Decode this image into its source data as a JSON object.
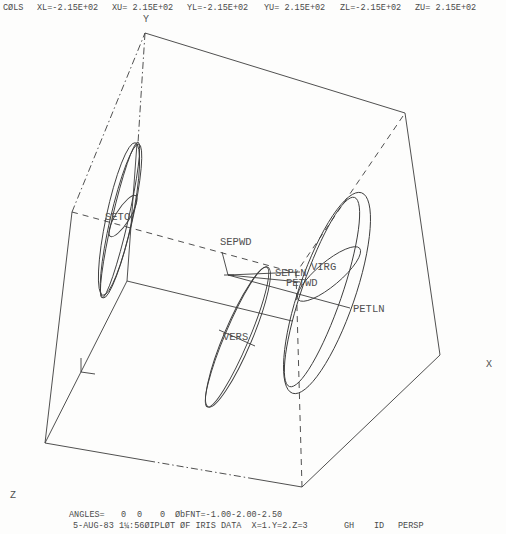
{
  "header": {
    "cols": "CØLS",
    "xl": "XL=-2.15E+02",
    "xu": "XU= 2.15E+02",
    "yl": "YL=-2.15E+02",
    "yu": "YU= 2.15E+02",
    "zl": "ZL=-2.15E+02",
    "zu": "ZU= 2.15E+02"
  },
  "axis_labels": {
    "x": "X",
    "y": "Y",
    "z": "Z"
  },
  "group_labels": {
    "seto": "SETO",
    "vers": "VERS",
    "virg": "VIRG"
  },
  "variable_labels": {
    "sepwd": "SEPWD",
    "sepln": "SEPLN",
    "petwd": "PETWD",
    "petln": "PETLN"
  },
  "footer": {
    "angles_label": "ANGLES=",
    "angles": [
      "0",
      "0",
      "0"
    ],
    "obpnt": "ØbFNT=-1.00-2.00-2.50",
    "info_line": "5-AUG-83 1¼:56ØIPLØT ØF IRIS DATA  X=1.Y=2.Z=3",
    "gh": "GH",
    "id": "ID",
    "persp": "PERSP"
  },
  "chart_data": {
    "type": "scatter",
    "subtype": "3d perspective group-ellipse plot",
    "title": "PLØT ØF IRIS DATA",
    "xlabel": "X",
    "ylabel": "Y",
    "zlabel": "Z",
    "axis_variables": {
      "x": 1,
      "y": 2,
      "z": 3
    },
    "xlim": [
      -215,
      215
    ],
    "ylim": [
      -215,
      215
    ],
    "zlim": [
      -215,
      215
    ],
    "angles": [
      0,
      0,
      0
    ],
    "observer_point": [
      -1.0,
      -2.0,
      -2.5
    ],
    "projection": "PERSP",
    "groups": [
      "SETO",
      "VERS",
      "VIRG"
    ],
    "variable_vectors": [
      "SEPWD",
      "SEPLN",
      "PETWD",
      "PETLN"
    ],
    "grid": false,
    "legend": null
  },
  "plot": {
    "stroke": "#3c3c3c",
    "solid_lines": [
      [
        145,
        33,
        405,
        113
      ],
      [
        405,
        113,
        440,
        355
      ],
      [
        440,
        355,
        302,
        487
      ],
      [
        302,
        487,
        255,
        479
      ],
      [
        155,
        462,
        45,
        443
      ],
      [
        45,
        443,
        72,
        212
      ],
      [
        45,
        443,
        127,
        281
      ],
      [
        127,
        281,
        292,
        321
      ],
      [
        127,
        281,
        137,
        143
      ],
      [
        228,
        275,
        222,
        252
      ],
      [
        228,
        275,
        300,
        272
      ],
      [
        228,
        275,
        300,
        282
      ],
      [
        228,
        275,
        350,
        308
      ],
      [
        224,
        275,
        234,
        275
      ],
      [
        81,
        358,
        81,
        372
      ],
      [
        81,
        372,
        95,
        374
      ],
      [
        219,
        330,
        255,
        346
      ]
    ],
    "dashdot_lines": [
      [
        255,
        479,
        155,
        462
      ],
      [
        72,
        212,
        145,
        33
      ],
      [
        145,
        33,
        138,
        143
      ]
    ],
    "dashed_lines": [
      [
        72,
        212,
        296,
        273
      ],
      [
        403,
        116,
        296,
        273
      ],
      [
        302,
        487,
        296,
        273
      ]
    ],
    "ellipses": [
      {
        "cx": 120,
        "cy": 220,
        "rx": 8,
        "ry": 80,
        "rot": 13
      },
      {
        "cx": 121,
        "cy": 221,
        "rx": 11,
        "ry": 79,
        "rot": 13
      },
      {
        "cx": 119,
        "cy": 219,
        "rx": 13,
        "ry": 78,
        "rot": 12
      },
      {
        "cx": 123,
        "cy": 216,
        "rx": 7,
        "ry": 24,
        "rot": 32
      },
      {
        "cx": 237,
        "cy": 337,
        "rx": 12,
        "ry": 76,
        "rot": 23
      },
      {
        "cx": 238,
        "cy": 337,
        "rx": 14,
        "ry": 76,
        "rot": 23
      },
      {
        "cx": 327,
        "cy": 293,
        "rx": 28,
        "ry": 106,
        "rot": 19
      },
      {
        "cx": 322,
        "cy": 292,
        "rx": 20,
        "ry": 100,
        "rot": 19
      },
      {
        "cx": 329,
        "cy": 274,
        "rx": 40,
        "ry": 12,
        "rot": -40
      }
    ]
  }
}
